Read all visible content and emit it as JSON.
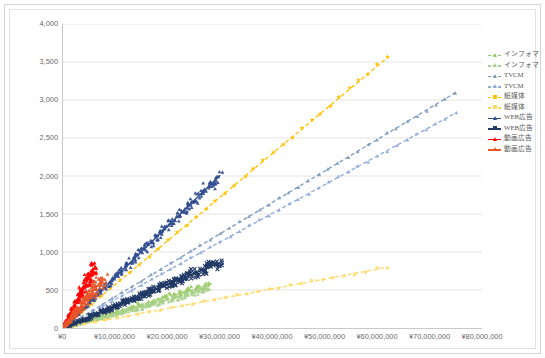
{
  "chart_data": {
    "type": "scatter",
    "title": "",
    "subtitle": "",
    "xlabel": "",
    "ylabel": "",
    "xlim": [
      0,
      80000000
    ],
    "ylim": [
      0,
      4000
    ],
    "grid": "horizontal",
    "legend_position": "right",
    "x_ticks": [
      "¥0",
      "¥10,000,000",
      "¥20,000,000",
      "¥30,000,000",
      "¥40,000,000",
      "¥50,000,000",
      "¥60,000,000",
      "¥70,000,000",
      "¥80,000,000"
    ],
    "x_tick_values": [
      0,
      10000000,
      20000000,
      30000000,
      40000000,
      50000000,
      60000000,
      70000000,
      80000000
    ],
    "y_ticks": [
      "0",
      "500",
      "1,000",
      "1,500",
      "2,000",
      "2,500",
      "3,000",
      "3,500",
      "4,000"
    ],
    "y_tick_values": [
      0,
      500,
      1000,
      1500,
      2000,
      2500,
      3000,
      3500,
      4000
    ],
    "series": [
      {
        "name": "インフォマ",
        "color": "#9ACB62",
        "line_style": "dashed",
        "marker": "triangle",
        "x_end": 28000000,
        "y_end": 570,
        "slope": 2.036e-05,
        "scatter": "dense",
        "jitter": 26,
        "points": 150
      },
      {
        "name": "インフォマ",
        "color": "#A9D18E",
        "line_style": "dashed",
        "marker": "triangle",
        "x_end": 28000000,
        "y_end": 520,
        "slope": 1.857e-05,
        "scatter": "dense",
        "jitter": 22,
        "points": 150
      },
      {
        "name": "TVCM",
        "color": "#7D9BC1",
        "line_style": "dashed",
        "marker": "triangle",
        "x_end": 75000000,
        "y_end": 3100,
        "slope": 4.133e-05,
        "scatter": "sparse",
        "jitter": 8,
        "points": 40
      },
      {
        "name": "TVCM",
        "color": "#8FAADC",
        "line_style": "dashed",
        "marker": "triangle",
        "x_end": 75000000,
        "y_end": 2830,
        "slope": 3.773e-05,
        "scatter": "sparse",
        "jitter": 8,
        "points": 40
      },
      {
        "name": "紙媒体",
        "color": "#FFC000",
        "line_style": "dashed",
        "marker": "star",
        "x_end": 62000000,
        "y_end": 3560,
        "slope": 5.742e-05,
        "scatter": "sparse",
        "jitter": 10,
        "points": 34
      },
      {
        "name": "紙媒体",
        "color": "#FFD966",
        "line_style": "dashed",
        "marker": "star",
        "x_end": 62000000,
        "y_end": 800,
        "slope": 1.29e-05,
        "scatter": "sparse",
        "jitter": 9,
        "points": 30
      },
      {
        "name": "WEB広告",
        "color": "#2F4C8E",
        "line_style": "solid",
        "marker": "triangle",
        "x_end": 30000000,
        "y_end": 2010,
        "slope": 6.7e-05,
        "scatter": "very-dense",
        "jitter": 34,
        "points": 240
      },
      {
        "name": "WEB広告",
        "color": "#1F3864",
        "line_style": "solid",
        "marker": "cross",
        "x_end": 30000000,
        "y_end": 860,
        "slope": 2.867e-05,
        "scatter": "very-dense",
        "jitter": 30,
        "points": 240
      },
      {
        "name": "動画広告",
        "color": "#FF0000",
        "line_style": "solid",
        "marker": "triangle",
        "x_end": 6200000,
        "y_end": 820,
        "slope": 0.0001323,
        "scatter": "very-dense",
        "jitter": 40,
        "points": 160
      },
      {
        "name": "動画広告",
        "color": "#E8562A",
        "line_style": "solid",
        "marker": "triangle",
        "x_end": 7600000,
        "y_end": 640,
        "slope": 8.421e-05,
        "scatter": "very-dense",
        "jitter": 36,
        "points": 160
      }
    ]
  },
  "legend": {
    "items": [
      {
        "label": "インフォマ",
        "color": "#9ACB62"
      },
      {
        "label": "インフォマ",
        "color": "#A9D18E"
      },
      {
        "label": "TVCM",
        "color": "#7D9BC1"
      },
      {
        "label": "TVCM",
        "color": "#8FAADC"
      },
      {
        "label": "紙媒体",
        "color": "#FFC000"
      },
      {
        "label": "紙媒体",
        "color": "#FFD966"
      },
      {
        "label": "WEB広告",
        "color": "#2F4C8E"
      },
      {
        "label": "WEB広告",
        "color": "#1F3864"
      },
      {
        "label": "動画広告",
        "color": "#FF0000"
      },
      {
        "label": "動画広告",
        "color": "#E8562A"
      }
    ]
  },
  "colors": {
    "grid": "#D9D9D9",
    "axis": "#C9C9C9",
    "tick_text": "#6B6B6B",
    "frame": "#D4D4D4",
    "background": "#FFFFFF"
  }
}
